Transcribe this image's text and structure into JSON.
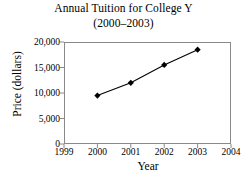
{
  "chart_data": {
    "type": "line",
    "title": "Annual Tuition for College Y",
    "subtitle": "(2000–2003)",
    "xlabel": "Year",
    "ylabel": "Price (dollars)",
    "x": [
      2000,
      2001,
      2002,
      2003
    ],
    "values": [
      9500,
      12000,
      15500,
      18500
    ],
    "series": [
      {
        "name": "Annual Tuition",
        "values": [
          9500,
          12000,
          15500,
          18500
        ]
      }
    ],
    "xlim": [
      1999,
      2004
    ],
    "ylim": [
      0,
      20000
    ],
    "xticks": [
      1999,
      2000,
      2001,
      2002,
      2003,
      2004
    ],
    "xtick_labels": [
      "1999",
      "2000",
      "2001",
      "2002",
      "2003",
      "2004"
    ],
    "yticks": [
      0,
      5000,
      10000,
      15000,
      20000
    ],
    "ytick_labels": [
      "0",
      "5,000",
      "10,000",
      "15,000",
      "20,000"
    ],
    "grid": false,
    "legend": false,
    "marker": "diamond",
    "line_color": "#000000",
    "marker_color": "#000000",
    "frame_color": "#8a8a8a",
    "background_color": "#ffffff"
  }
}
